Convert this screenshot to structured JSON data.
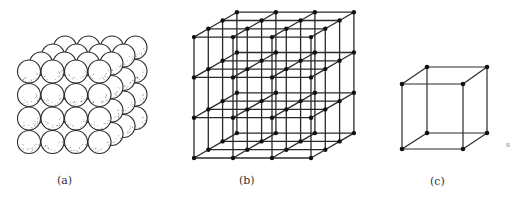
{
  "figure": {
    "panels": [
      {
        "id": "a",
        "label": "(a)",
        "description": "close-packed spheres arranged in a cubic block",
        "grid": [
          4,
          4,
          4
        ]
      },
      {
        "id": "b",
        "label": "(b)",
        "description": "simple cubic lattice of points joined by lines",
        "grid": [
          4,
          4,
          4
        ]
      },
      {
        "id": "c",
        "label": "(c)",
        "description": "single unit cube with lattice points at corners"
      }
    ],
    "stray_mark": "s",
    "colors": {
      "line": "#2a2a2a",
      "node": "#111111",
      "sphere_fill": "#ffffff",
      "stipple": "#555555"
    }
  }
}
